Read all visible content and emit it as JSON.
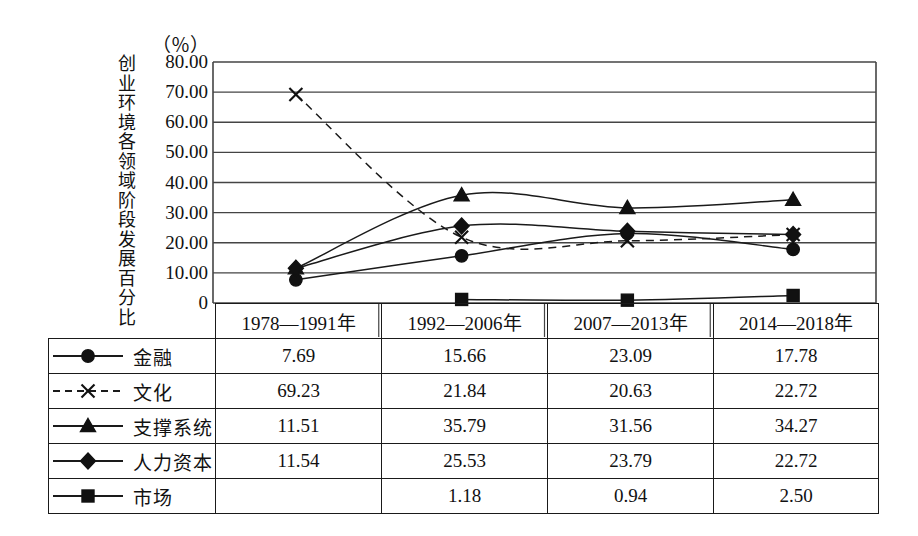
{
  "chart_data": {
    "type": "line",
    "title": "",
    "ylabel": "创业环境各领域阶段发展百分比",
    "unit_label": "（％）",
    "xlabel": "",
    "categories": [
      "1978—1991年",
      "1992—2006年",
      "2007—2013年",
      "2014—2018年"
    ],
    "ylim": [
      0,
      80
    ],
    "ytick_labels": [
      "80.00",
      "70.00",
      "60.00",
      "50.00",
      "40.00",
      "30.00",
      "20.00",
      "10.00",
      "0"
    ],
    "ytick_values": [
      80,
      70,
      60,
      50,
      40,
      30,
      20,
      10,
      0
    ],
    "grid": true,
    "legend_position": "table-left-column",
    "series": [
      {
        "name": "金融",
        "marker": "circle",
        "line_style": "solid",
        "values": [
          7.69,
          15.66,
          23.09,
          17.78
        ],
        "cells": [
          "7.69",
          "15.66",
          "23.09",
          "17.78"
        ]
      },
      {
        "name": "文化",
        "marker": "x",
        "line_style": "dashed",
        "values": [
          69.23,
          21.84,
          20.63,
          22.72
        ],
        "cells": [
          "69.23",
          "21.84",
          "20.63",
          "22.72"
        ]
      },
      {
        "name": "支撑系统",
        "marker": "triangle",
        "line_style": "solid",
        "values": [
          11.51,
          35.79,
          31.56,
          34.27
        ],
        "cells": [
          "11.51",
          "35.79",
          "31.56",
          "34.27"
        ]
      },
      {
        "name": "人力资本",
        "marker": "diamond",
        "line_style": "solid",
        "values": [
          11.54,
          25.53,
          23.79,
          22.72
        ],
        "cells": [
          "11.54",
          "25.53",
          "23.79",
          "22.72"
        ]
      },
      {
        "name": "市场",
        "marker": "square",
        "line_style": "solid",
        "values": [
          null,
          1.18,
          0.94,
          2.5
        ],
        "cells": [
          "",
          "1.18",
          "0.94",
          "2.50"
        ]
      }
    ],
    "colors": {
      "line": "#1a1a1a",
      "marker": "#111111",
      "grid": "#444444",
      "background": "#ffffff"
    }
  }
}
